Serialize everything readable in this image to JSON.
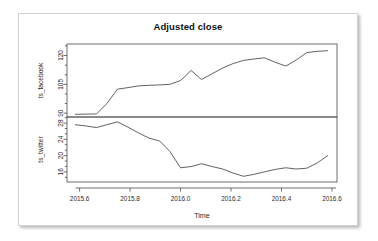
{
  "figure": {
    "title": "Adjusted close",
    "xlabel": "Time"
  },
  "chart_data": {
    "type": "line",
    "title": "Adjusted close",
    "xlabel": "Time",
    "ylabel": "",
    "layout": "stacked-panels",
    "panels": 2,
    "grid": false,
    "legend": "none",
    "xlim": [
      2015.55,
      2016.62
    ],
    "xticks": [
      "2015.6",
      "2015.8",
      "2016.0",
      "2016.2",
      "2016.4",
      "2016.6"
    ],
    "xtick_values": [
      2015.6,
      2015.8,
      2016.0,
      2016.2,
      2016.4,
      2016.6
    ],
    "series": [
      {
        "name": "ts_facebook",
        "panel": 0,
        "ylabel": "ts_facebook",
        "ylim": [
          88,
          126
        ],
        "yticks": [
          "90",
          "105",
          "120"
        ],
        "ytick_values": [
          90,
          105,
          120
        ],
        "x": [
          2015.583,
          2015.625,
          2015.667,
          2015.708,
          2015.75,
          2015.792,
          2015.833,
          2015.875,
          2015.917,
          2015.958,
          2016.0,
          2016.042,
          2016.083,
          2016.125,
          2016.167,
          2016.208,
          2016.25,
          2016.292,
          2016.333,
          2016.375,
          2016.417,
          2016.458,
          2016.5,
          2016.542,
          2016.583
        ],
        "values": [
          89.4,
          89.5,
          89.6,
          95.0,
          102.5,
          103.3,
          104.2,
          104.5,
          104.7,
          105.0,
          107.0,
          112.2,
          107.5,
          110.5,
          113.5,
          115.8,
          117.5,
          118.2,
          118.8,
          116.5,
          114.5,
          117.6,
          121.5,
          122.2,
          122.5
        ]
      },
      {
        "name": "ts_twitter",
        "panel": 1,
        "ylabel": "ts_twitter",
        "ylim": [
          13.5,
          29.5
        ],
        "yticks": [
          "16",
          "20",
          "24",
          "28"
        ],
        "ytick_values": [
          16,
          20,
          24,
          28
        ],
        "x": [
          2015.583,
          2015.625,
          2015.667,
          2015.708,
          2015.75,
          2015.792,
          2015.833,
          2015.875,
          2015.917,
          2015.958,
          2016.0,
          2016.042,
          2016.083,
          2016.125,
          2016.167,
          2016.208,
          2016.25,
          2016.292,
          2016.333,
          2016.375,
          2016.417,
          2016.458,
          2016.5,
          2016.542,
          2016.583
        ],
        "values": [
          27.6,
          27.3,
          26.9,
          27.6,
          28.3,
          27.0,
          25.6,
          24.3,
          23.6,
          21.0,
          17.0,
          17.3,
          18.0,
          17.3,
          16.7,
          15.7,
          14.9,
          15.4,
          16.0,
          16.6,
          17.0,
          16.7,
          16.9,
          18.2,
          20.0
        ]
      }
    ]
  }
}
